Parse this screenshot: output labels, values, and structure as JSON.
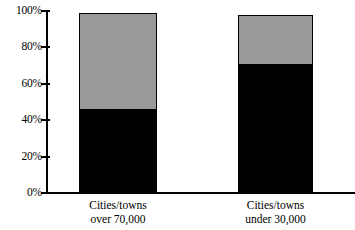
{
  "chart_data": {
    "type": "bar",
    "subtype": "stacked-bar",
    "title": "",
    "subtitle": "",
    "xlabel": "",
    "ylabel": "",
    "ylim": [
      0,
      100
    ],
    "yticks": [
      0,
      20,
      40,
      60,
      80,
      100
    ],
    "ytick_labels": [
      "0%",
      "20%",
      "40%",
      "60%",
      "80%",
      "100%"
    ],
    "grid": false,
    "legend": false,
    "legend_position": "none",
    "categories": [
      "Cities/towns over 70,000",
      "Cities/towns under 30,000"
    ],
    "category_lines": [
      {
        "line1": "Cities/towns",
        "line2": "over 70,000"
      },
      {
        "line1": "Cities/towns",
        "line2": "under 30,000"
      }
    ],
    "series": [
      {
        "name": "black-segment",
        "color": "#000000",
        "values": [
          46,
          71
        ]
      },
      {
        "name": "gray-segment",
        "color": "#999999",
        "values": [
          53,
          27
        ]
      }
    ],
    "totals": [
      99,
      98
    ]
  },
  "colors": {
    "background": "#ffffff",
    "axis": "#000000",
    "black_segment": "#000000",
    "gray_segment": "#999999",
    "bar_outline": "#000000"
  }
}
